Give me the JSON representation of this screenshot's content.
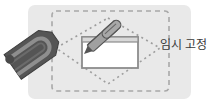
{
  "illustration": {
    "label": "임시 고정",
    "colors": {
      "panel": "#e9e9e9",
      "dash": "#a8a8a8",
      "window_fill": "#ffffff",
      "window_frame": "#8c8c8c",
      "pen_body": "#9a9a9a",
      "pen_dark": "#555555",
      "magnet_outer": "#5a5a5a",
      "magnet_inner": "#8e8e8e",
      "text": "#3a3a3a"
    },
    "icons": [
      "magnet-icon",
      "pen-icon",
      "window-icon",
      "dashed-region-icon"
    ]
  }
}
